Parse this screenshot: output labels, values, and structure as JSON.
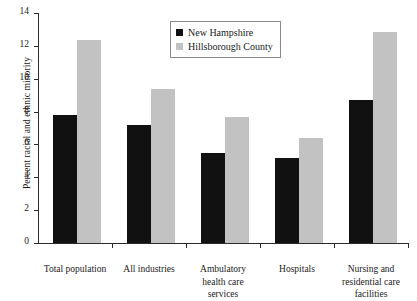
{
  "chart_data": {
    "type": "bar",
    "title": "",
    "xlabel": "",
    "ylabel": "Percent racial and ethnic minority",
    "ylim": [
      0,
      14
    ],
    "ytick_labels": [
      "0",
      "2",
      "4",
      "6",
      "8",
      "10",
      "12",
      "14"
    ],
    "ytick_values": [
      0,
      2,
      4,
      6,
      8,
      10,
      12,
      14
    ],
    "grid": false,
    "legend_position": "top-center",
    "categories": [
      "Total population",
      "All industries",
      "Ambulatory health care services",
      "Hospitals",
      "Nursing and residential care facilities"
    ],
    "category_lines": [
      [
        "Total population"
      ],
      [
        "All industries"
      ],
      [
        "Ambulatory",
        "health care",
        "services"
      ],
      [
        "Hospitals"
      ],
      [
        "Nursing and",
        "residential care",
        "facilities"
      ]
    ],
    "series": [
      {
        "name": "New Hampshire",
        "color": "#111111",
        "values": [
          7.8,
          7.2,
          5.5,
          5.2,
          8.7
        ]
      },
      {
        "name": "Hillsborough County",
        "color": "#c2c2c2",
        "values": [
          12.35,
          9.4,
          7.65,
          6.4,
          12.85
        ]
      }
    ]
  }
}
